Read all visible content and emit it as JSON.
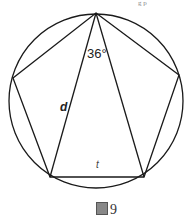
{
  "figure": {
    "top_fragment": "g  p",
    "angle_label": "36°",
    "diagonal_label": "d",
    "side_label": "t",
    "caption_number": "9",
    "caption_icon": "figure-glyph-icon"
  },
  "geometry": {
    "circle": {
      "cx": 96,
      "cy": 101,
      "r": 87
    },
    "pentagon": [
      [
        96,
        13
      ],
      [
        179,
        75
      ],
      [
        144,
        177
      ],
      [
        50,
        177
      ],
      [
        13,
        78
      ]
    ],
    "stroke_color": "#1a1a1a"
  }
}
